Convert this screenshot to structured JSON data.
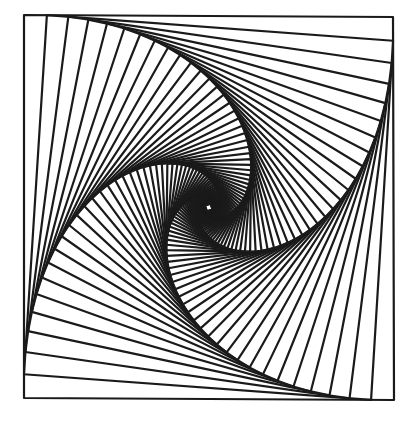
{
  "figure": {
    "stroke_color": "#1a1a1a",
    "background_color": "#ffffff",
    "stroke_width": 2.2,
    "outer_square": {
      "corners": [
        [
          24,
          15
        ],
        [
          393,
          17
        ],
        [
          394,
          400
        ],
        [
          24,
          398
        ]
      ]
    },
    "pursuit_ratio": 0.062,
    "iterations": 90
  }
}
